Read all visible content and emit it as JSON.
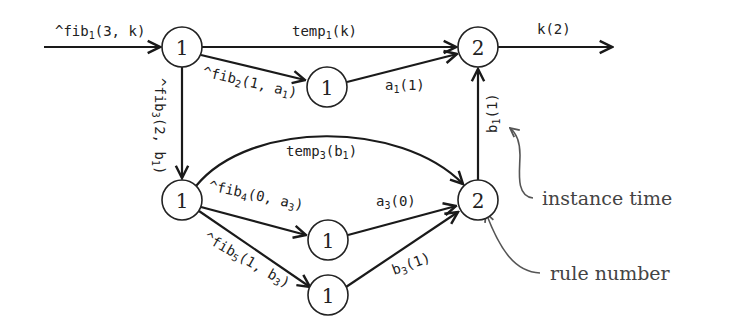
{
  "diagram": {
    "type": "directed-graph",
    "nodes": [
      {
        "id": "n1",
        "label": "1",
        "x": 182,
        "y": 47
      },
      {
        "id": "n2",
        "label": "1",
        "x": 327,
        "y": 87
      },
      {
        "id": "n3",
        "label": "2",
        "x": 478,
        "y": 47
      },
      {
        "id": "n4",
        "label": "1",
        "x": 182,
        "y": 200
      },
      {
        "id": "n5",
        "label": "2",
        "x": 478,
        "y": 200
      },
      {
        "id": "n6",
        "label": "1",
        "x": 328,
        "y": 240
      },
      {
        "id": "n7",
        "label": "1",
        "x": 328,
        "y": 295
      }
    ],
    "edges": [
      {
        "from": "input",
        "to": "n1",
        "label": "^fib1(3,k)"
      },
      {
        "from": "n1",
        "to": "n3",
        "label": "temp1(k)"
      },
      {
        "from": "n1",
        "to": "n2",
        "label": "^fib2(1,a1)"
      },
      {
        "from": "n2",
        "to": "n3",
        "label": "a1(1)"
      },
      {
        "from": "n1",
        "to": "n4",
        "label": "^fib3(2,b1)"
      },
      {
        "from": "n3",
        "to": "output",
        "label": "k(2)"
      },
      {
        "from": "n4",
        "to": "n5",
        "label": "temp3(b1)"
      },
      {
        "from": "n4",
        "to": "n6",
        "label": "^fib4(0,a3)"
      },
      {
        "from": "n4",
        "to": "n7",
        "label": "^fib5(1,b3)"
      },
      {
        "from": "n6",
        "to": "n5",
        "label": "a3(0)"
      },
      {
        "from": "n7",
        "to": "n5",
        "label": "b3(1)"
      },
      {
        "from": "n5",
        "to": "n3",
        "label": "b1(1)"
      }
    ]
  },
  "labels": {
    "fib1": {
      "pre": "^fib",
      "sub": "1",
      "post": "(3, k)"
    },
    "temp1": {
      "pre": "temp",
      "sub": "1",
      "post": "(k)"
    },
    "k2": {
      "pre": "k(2)"
    },
    "fib2": {
      "pre": "^fib",
      "sub": "2",
      "post": "(1, a",
      "sub2": "1",
      "post2": ")"
    },
    "a1": {
      "pre": "a",
      "sub": "1",
      "post": "(1)"
    },
    "fib3": {
      "pre": "^fib",
      "sub": "3",
      "post": "(2, b",
      "sub2": "1",
      "post2": ")"
    },
    "b1": {
      "pre": "b",
      "sub": "1",
      "post": "(1)"
    },
    "temp3": {
      "pre": "temp",
      "sub": "3",
      "post": "(b",
      "sub2": "1",
      "post2": ")"
    },
    "fib4": {
      "pre": "^fib",
      "sub": "4",
      "post": "(0, a",
      "sub2": "3",
      "post2": ")"
    },
    "a3": {
      "pre": "a",
      "sub": "3",
      "post": "(0)"
    },
    "fib5": {
      "pre": "^fib",
      "sub": "5",
      "post": "(1, b",
      "sub2": "3",
      "post2": ")"
    },
    "b3": {
      "pre": "b",
      "sub": "3",
      "post": "(1)"
    }
  },
  "annotations": {
    "instance_time": "instance time",
    "rule_number": "rule number"
  }
}
